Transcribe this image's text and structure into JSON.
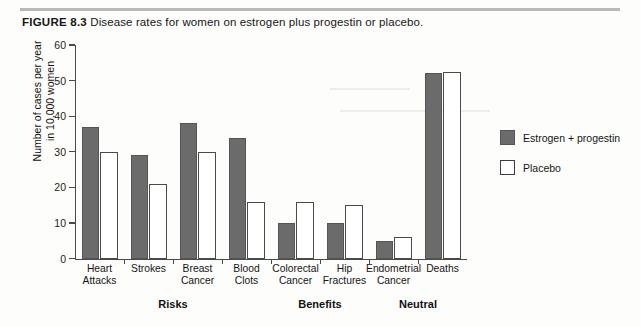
{
  "figure": {
    "number_label": "FIGURE 8.3",
    "caption": "Disease rates for women on estrogen plus progestin or placebo."
  },
  "chart_data": {
    "type": "bar",
    "title": "Disease rates for women on estrogen plus progestin or placebo.",
    "xlabel": "",
    "ylabel": "Number of cases per year\nin 10,000 women",
    "ylabel_line1": "Number of cases per year",
    "ylabel_line2": "in 10,000 women",
    "ylim": [
      0,
      60
    ],
    "yticks": [
      0,
      10,
      20,
      30,
      40,
      50,
      60
    ],
    "grid": false,
    "legend_position": "right",
    "categories": [
      "Heart\nAttacks",
      "Strokes",
      "Breast\nCancer",
      "Blood\nClots",
      "Colorectal\nCancer",
      "Hip\nFractures",
      "Endometrial\nCancer",
      "Deaths"
    ],
    "series": [
      {
        "name": "Estrogen + progestin",
        "color": "#6b6b6b",
        "values": [
          37,
          29,
          38,
          34,
          10,
          10,
          5,
          52
        ]
      },
      {
        "name": "Placebo",
        "color": "#ffffff",
        "values": [
          30,
          21,
          30,
          16,
          16,
          15,
          6,
          52.5
        ]
      }
    ],
    "group_annotations": [
      {
        "label": "Risks",
        "categories": [
          "Heart Attacks",
          "Strokes",
          "Breast Cancer",
          "Blood Clots"
        ]
      },
      {
        "label": "Benefits",
        "categories": [
          "Colorectal Cancer",
          "Hip Fractures"
        ]
      },
      {
        "label": "Neutral",
        "categories": [
          "Endometrial Cancer",
          "Deaths"
        ]
      }
    ]
  }
}
